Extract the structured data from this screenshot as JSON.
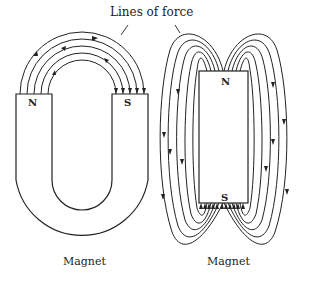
{
  "title": "Lines of force",
  "horseshoe_magnet": {
    "caption": "Magnet",
    "north_label": "N",
    "south_label": "S",
    "field_line_count": 5,
    "field_direction": "N to S"
  },
  "bar_magnet": {
    "caption": "Magnet",
    "north_label": "N",
    "south_label": "S",
    "field_lines_per_side": 5,
    "field_direction": "N to S"
  },
  "colors": {
    "line": "#222222",
    "background": "#ffffff"
  }
}
